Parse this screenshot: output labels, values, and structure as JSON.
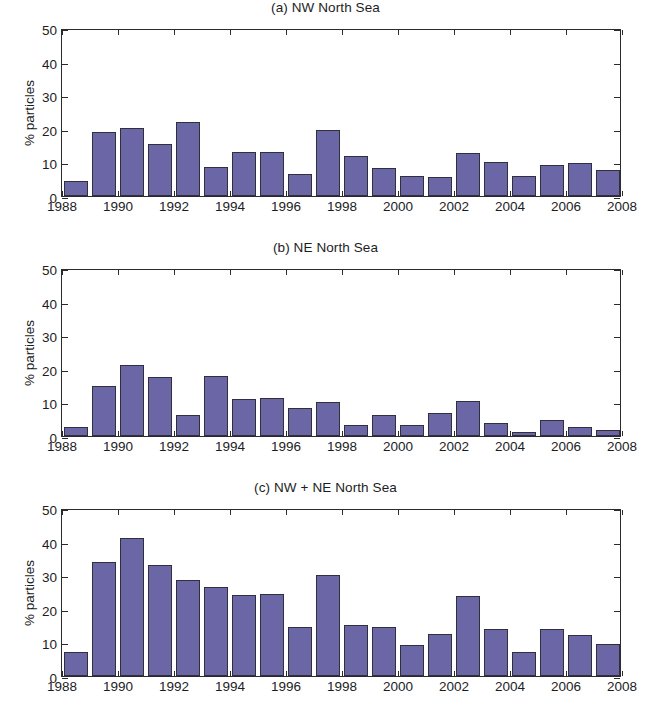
{
  "figure": {
    "background": "#ffffff",
    "bar_color": "#6b66a6",
    "bar_edge_color": "#2f2f3d",
    "axis_color": "#2b2b2b",
    "text_color": "#1d1d1d"
  },
  "chart_data": [
    {
      "type": "bar",
      "title": "(a) NW North Sea",
      "xlabel": "",
      "ylabel": "% particles",
      "ylim": [
        0,
        50
      ],
      "xlim": [
        1988,
        2008
      ],
      "yticks": [
        0,
        10,
        20,
        30,
        40,
        50
      ],
      "xticks": [
        1988,
        1990,
        1992,
        1994,
        1996,
        1998,
        2000,
        2002,
        2004,
        2006,
        2008
      ],
      "grid": false,
      "legend": "none",
      "categories": [
        1988,
        1989,
        1990,
        1991,
        1992,
        1993,
        1994,
        1995,
        1996,
        1997,
        1998,
        1999,
        2000,
        2001,
        2002,
        2003,
        2004,
        2005,
        2006,
        2007
      ],
      "values": [
        4.5,
        19.1,
        20.2,
        15.6,
        22.1,
        8.7,
        13.1,
        13.2,
        6.5,
        19.7,
        12.0,
        8.3,
        5.9,
        5.7,
        12.9,
        10.1,
        5.9,
        9.3,
        9.7,
        7.8
      ]
    },
    {
      "type": "bar",
      "title": "(b) NE North Sea",
      "xlabel": "",
      "ylabel": "% particles",
      "ylim": [
        0,
        50
      ],
      "xlim": [
        1988,
        2008
      ],
      "yticks": [
        0,
        10,
        20,
        30,
        40,
        50
      ],
      "xticks": [
        1988,
        1990,
        1992,
        1994,
        1996,
        1998,
        2000,
        2002,
        2004,
        2006,
        2008
      ],
      "grid": false,
      "legend": "none",
      "categories": [
        1988,
        1989,
        1990,
        1991,
        1992,
        1993,
        1994,
        1995,
        1996,
        1997,
        1998,
        1999,
        2000,
        2001,
        2002,
        2003,
        2004,
        2005,
        2006,
        2007
      ],
      "values": [
        2.6,
        14.8,
        21.0,
        17.6,
        6.3,
        17.9,
        11.1,
        11.4,
        8.4,
        10.1,
        3.3,
        6.4,
        3.3,
        6.8,
        10.5,
        3.8,
        1.3,
        4.8,
        2.6,
        1.7
      ]
    },
    {
      "type": "bar",
      "title": "(c) NW + NE North Sea",
      "xlabel": "",
      "ylabel": "% particles",
      "ylim": [
        0,
        50
      ],
      "xlim": [
        1988,
        2008
      ],
      "yticks": [
        0,
        10,
        20,
        30,
        40,
        50
      ],
      "xticks": [
        1988,
        1990,
        1992,
        1994,
        1996,
        1998,
        2000,
        2002,
        2004,
        2006,
        2008
      ],
      "grid": false,
      "legend": "none",
      "categories": [
        1988,
        1989,
        1990,
        1991,
        1992,
        1993,
        1994,
        1995,
        1996,
        1997,
        1998,
        1999,
        2000,
        2001,
        2002,
        2003,
        2004,
        2005,
        2006,
        2007
      ],
      "values": [
        7.1,
        33.8,
        41.1,
        32.9,
        28.5,
        26.6,
        24.2,
        24.5,
        14.7,
        30.0,
        15.3,
        14.7,
        9.1,
        12.5,
        23.7,
        14.1,
        7.2,
        14.1,
        12.3,
        9.6
      ]
    }
  ]
}
